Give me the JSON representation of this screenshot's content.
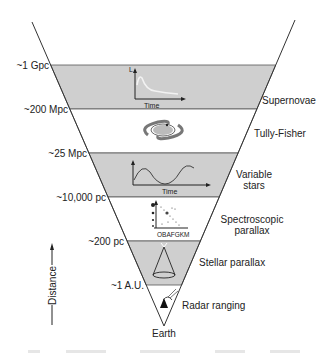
{
  "diagram": {
    "colors": {
      "band_gray": "#cfcfcf",
      "band_white": "#ffffff",
      "line": "#333333"
    },
    "distance_labels": [
      "~1 Gpc",
      "~200 Mpc",
      "~25 Mpc",
      "~10,000 pc",
      "~200 pc",
      "~1 A.U."
    ],
    "methods": [
      {
        "name": "Supernovae",
        "lines": [
          "Supernovae"
        ],
        "icon": "light-curve-icon",
        "axis_labels": [
          "L",
          "Time"
        ]
      },
      {
        "name": "Tully-Fisher",
        "lines": [
          "Tully-Fisher"
        ],
        "icon": "spiral-galaxy-icon"
      },
      {
        "name": "Variable stars",
        "lines": [
          "Variable",
          "stars"
        ],
        "icon": "periodic-light-curve-icon",
        "axis_labels": [
          "Time"
        ]
      },
      {
        "name": "Spectroscopic parallax",
        "lines": [
          "Spectroscopic",
          "parallax"
        ],
        "icon": "hr-diagram-icon",
        "axis_labels": [
          "OBAFGKM"
        ]
      },
      {
        "name": "Stellar parallax",
        "lines": [
          "Stellar parallax"
        ],
        "icon": "parallax-cone-icon"
      },
      {
        "name": "Radar ranging",
        "lines": [
          "Radar ranging"
        ],
        "icon": "radar-dish-icon"
      }
    ],
    "apex_label": "Earth",
    "axis_label": "Distance"
  }
}
